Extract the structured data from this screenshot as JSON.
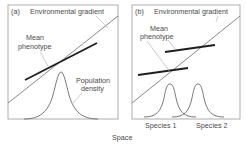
{
  "figure": {
    "x_axis_label": "Space",
    "panels": [
      {
        "id": "a",
        "tag": "(a)",
        "gradient_label": "Environmental gradient",
        "phenotype_label_line1": "Mean",
        "phenotype_label_line2": "phenotype",
        "density_label_line1": "Population",
        "density_label_line2": "density"
      },
      {
        "id": "b",
        "tag": "(b)",
        "gradient_label": "Environmental gradient",
        "phenotype_label_line1": "Mean",
        "phenotype_label_line2": "phenotype",
        "species": [
          "Species 1",
          "Species 2"
        ]
      }
    ]
  },
  "colors": {
    "box": "#9a9a9a",
    "gradient_line": "#6a6a6a",
    "phenotype_line": "#1e1e1e",
    "density_curve": "#6a6a6a",
    "text": "#4a4a4a"
  }
}
